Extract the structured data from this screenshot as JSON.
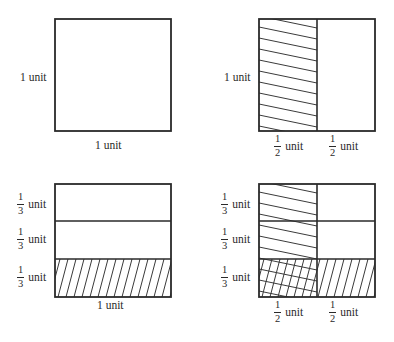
{
  "figures": {
    "top_left": {
      "title": "whole unit square",
      "left_label": "1 unit",
      "bottom_label": "1 unit"
    },
    "top_right": {
      "title": "square split in halves, left half shaded",
      "left_label": "1 unit",
      "bottom_labels": [
        {
          "numerator": "1",
          "denominator": "2",
          "unit": "unit"
        },
        {
          "numerator": "1",
          "denominator": "2",
          "unit": "unit"
        }
      ]
    },
    "bottom_left": {
      "title": "square split in thirds, bottom third shaded",
      "left_labels": [
        {
          "numerator": "1",
          "denominator": "3",
          "unit": "unit"
        },
        {
          "numerator": "1",
          "denominator": "3",
          "unit": "unit"
        },
        {
          "numerator": "1",
          "denominator": "3",
          "unit": "unit"
        }
      ],
      "bottom_label": "1 unit"
    },
    "bottom_right": {
      "title": "halves and thirds overlap, cross-hatched sixth",
      "left_labels": [
        {
          "numerator": "1",
          "denominator": "3",
          "unit": "unit"
        },
        {
          "numerator": "1",
          "denominator": "3",
          "unit": "unit"
        },
        {
          "numerator": "1",
          "denominator": "3",
          "unit": "unit"
        }
      ],
      "bottom_labels": [
        {
          "numerator": "1",
          "denominator": "2",
          "unit": "unit"
        },
        {
          "numerator": "1",
          "denominator": "2",
          "unit": "unit"
        }
      ]
    }
  },
  "colors": {
    "stroke": "#2a2a2a",
    "background": "#ffffff"
  }
}
